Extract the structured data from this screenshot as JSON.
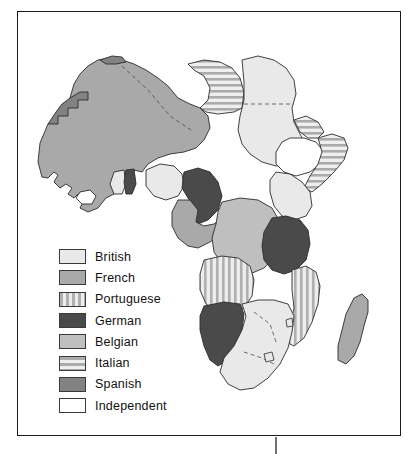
{
  "figure": {
    "frame": {
      "border_color": "#1a1a1a"
    }
  },
  "legend": {
    "items": [
      {
        "label": "British",
        "pattern": "solid",
        "color": "#e9e9e9"
      },
      {
        "label": "French",
        "pattern": "solid",
        "color": "#a9a9a9"
      },
      {
        "label": "Portuguese",
        "pattern": "vertical-stripes",
        "color": "#d8d8d8"
      },
      {
        "label": "German",
        "pattern": "solid",
        "color": "#4a4a4a"
      },
      {
        "label": "Belgian",
        "pattern": "solid",
        "color": "#bfbfbf"
      },
      {
        "label": "Italian",
        "pattern": "horizontal-stripes",
        "color": "#cfcfcf"
      },
      {
        "label": "Spanish",
        "pattern": "solid",
        "color": "#828282"
      },
      {
        "label": "Independent",
        "pattern": "solid",
        "color": "#ffffff"
      }
    ]
  },
  "map": {
    "outline_color": "#2b2b2b",
    "background": "#ffffff",
    "regions": [
      {
        "name": "spanish-morocco",
        "power": "Spanish",
        "fill": "#828282"
      },
      {
        "name": "french-north-africa",
        "power": "French",
        "fill": "#a9a9a9"
      },
      {
        "name": "rio-de-oro",
        "power": "Spanish",
        "fill": "#828282"
      },
      {
        "name": "italian-libya",
        "power": "Italian",
        "fill": "#cfcfcf"
      },
      {
        "name": "british-egypt-sudan",
        "power": "British",
        "fill": "#e9e9e9"
      },
      {
        "name": "italian-eritrea",
        "power": "Italian",
        "fill": "#cfcfcf"
      },
      {
        "name": "ethiopia",
        "power": "Independent",
        "fill": "#ffffff"
      },
      {
        "name": "italian-somaliland",
        "power": "Italian",
        "fill": "#cfcfcf"
      },
      {
        "name": "french-west-africa",
        "power": "French",
        "fill": "#a9a9a9"
      },
      {
        "name": "liberia",
        "power": "Independent",
        "fill": "#ffffff"
      },
      {
        "name": "gold-coast",
        "power": "British",
        "fill": "#e9e9e9"
      },
      {
        "name": "togoland",
        "power": "German",
        "fill": "#4a4a4a"
      },
      {
        "name": "nigeria",
        "power": "British",
        "fill": "#e9e9e9"
      },
      {
        "name": "kamerun",
        "power": "German",
        "fill": "#4a4a4a"
      },
      {
        "name": "french-equatorial-africa",
        "power": "French",
        "fill": "#a9a9a9"
      },
      {
        "name": "belgian-congo",
        "power": "Belgian",
        "fill": "#bfbfbf"
      },
      {
        "name": "british-east-africa",
        "power": "British",
        "fill": "#e9e9e9"
      },
      {
        "name": "german-east-africa",
        "power": "German",
        "fill": "#4a4a4a"
      },
      {
        "name": "angola",
        "power": "Portuguese",
        "fill": "#d8d8d8"
      },
      {
        "name": "mozambique",
        "power": "Portuguese",
        "fill": "#d8d8d8"
      },
      {
        "name": "german-south-west-africa",
        "power": "German",
        "fill": "#4a4a4a"
      },
      {
        "name": "british-south-africa",
        "power": "British",
        "fill": "#e9e9e9"
      },
      {
        "name": "madagascar",
        "power": "French",
        "fill": "#a9a9a9"
      }
    ]
  }
}
